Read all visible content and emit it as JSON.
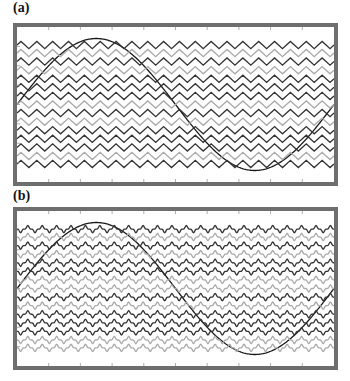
{
  "chart_data": [
    {
      "type": "line",
      "panel_label": "(a)",
      "title": "",
      "xlabel": "",
      "ylabel": "",
      "grid": false,
      "legend": null,
      "x_ticks_count": 10,
      "series": [
        {
          "name": "reference-sine",
          "shape": "sine",
          "periods": 1,
          "color": "#1a1a1a",
          "amplitude_norm": 1.0
        },
        {
          "name": "carrier-01",
          "shape": "triangle",
          "color": "#333333",
          "offset_norm": 0.9
        },
        {
          "name": "carrier-02",
          "shape": "triangle",
          "color": "#aaaaaa",
          "offset_norm": 0.78
        },
        {
          "name": "carrier-03",
          "shape": "triangle",
          "color": "#333333",
          "offset_norm": 0.65
        },
        {
          "name": "carrier-04",
          "shape": "triangle",
          "color": "#aaaaaa",
          "offset_norm": 0.52
        },
        {
          "name": "carrier-05",
          "shape": "triangle",
          "color": "#333333",
          "offset_norm": 0.39
        },
        {
          "name": "carrier-06",
          "shape": "triangle",
          "color": "#333333",
          "offset_norm": 0.26
        },
        {
          "name": "carrier-07",
          "shape": "triangle",
          "color": "#333333",
          "offset_norm": 0.13
        },
        {
          "name": "carrier-08",
          "shape": "triangle",
          "color": "#aaaaaa",
          "offset_norm": 0.0
        },
        {
          "name": "carrier-09",
          "shape": "triangle",
          "color": "#333333",
          "offset_norm": -0.13
        },
        {
          "name": "carrier-10",
          "shape": "triangle",
          "color": "#aaaaaa",
          "offset_norm": -0.26
        },
        {
          "name": "carrier-11",
          "shape": "triangle",
          "color": "#333333",
          "offset_norm": -0.39
        },
        {
          "name": "carrier-12",
          "shape": "triangle",
          "color": "#333333",
          "offset_norm": -0.52
        },
        {
          "name": "carrier-13",
          "shape": "triangle",
          "color": "#333333",
          "offset_norm": -0.65
        },
        {
          "name": "carrier-14",
          "shape": "triangle",
          "color": "#aaaaaa",
          "offset_norm": -0.78
        },
        {
          "name": "carrier-15",
          "shape": "triangle",
          "color": "#333333",
          "offset_norm": -0.9
        }
      ],
      "carrier_cycles": 20
    },
    {
      "type": "line",
      "panel_label": "(b)",
      "title": "",
      "xlabel": "",
      "ylabel": "",
      "grid": false,
      "legend": null,
      "x_ticks_count": 10,
      "series": [
        {
          "name": "reference-sine",
          "shape": "sine",
          "periods": 1,
          "color": "#1a1a1a",
          "amplitude_norm": 1.0
        },
        {
          "name": "carrier-01",
          "shape": "cusp",
          "color": "#333333",
          "offset_norm": 0.9
        },
        {
          "name": "carrier-02",
          "shape": "cusp",
          "color": "#aaaaaa",
          "offset_norm": 0.78
        },
        {
          "name": "carrier-03",
          "shape": "cusp",
          "color": "#333333",
          "offset_norm": 0.65
        },
        {
          "name": "carrier-04",
          "shape": "cusp",
          "color": "#aaaaaa",
          "offset_norm": 0.52
        },
        {
          "name": "carrier-05",
          "shape": "cusp",
          "color": "#333333",
          "offset_norm": 0.39
        },
        {
          "name": "carrier-06",
          "shape": "cusp",
          "color": "#333333",
          "offset_norm": 0.26
        },
        {
          "name": "carrier-07",
          "shape": "cusp",
          "color": "#aaaaaa",
          "offset_norm": 0.13
        },
        {
          "name": "carrier-08",
          "shape": "cusp",
          "color": "#aaaaaa",
          "offset_norm": 0.0
        },
        {
          "name": "carrier-09",
          "shape": "cusp",
          "color": "#333333",
          "offset_norm": -0.13
        },
        {
          "name": "carrier-10",
          "shape": "cusp",
          "color": "#aaaaaa",
          "offset_norm": -0.26
        },
        {
          "name": "carrier-11",
          "shape": "cusp",
          "color": "#333333",
          "offset_norm": -0.39
        },
        {
          "name": "carrier-12",
          "shape": "cusp",
          "color": "#333333",
          "offset_norm": -0.52
        },
        {
          "name": "carrier-13",
          "shape": "cusp",
          "color": "#333333",
          "offset_norm": -0.65
        },
        {
          "name": "carrier-14",
          "shape": "cusp",
          "color": "#aaaaaa",
          "offset_norm": -0.78
        },
        {
          "name": "carrier-15",
          "shape": "cusp",
          "color": "#aaaaaa",
          "offset_norm": -0.9
        }
      ],
      "carrier_cycles": 22
    }
  ],
  "figure": {
    "panels": [
      {
        "label": "(a)"
      },
      {
        "label": "(b)"
      }
    ],
    "frame_color": "#6e6e6e",
    "tick_color": "#9a9a9a"
  }
}
